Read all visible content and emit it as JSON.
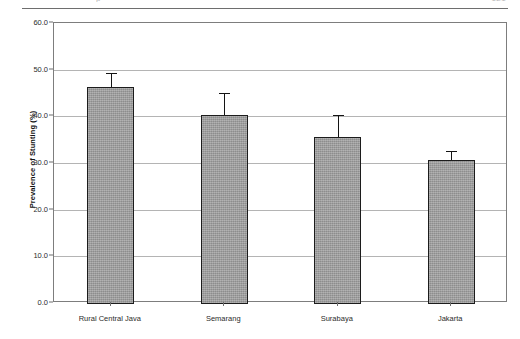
{
  "page_header": {
    "clipped_left_text": "p",
    "clipped_right_text": "121"
  },
  "figure": {
    "y_axis_title": "Prevalence of Stunting (%)"
  },
  "chart_data": {
    "type": "bar",
    "title": "",
    "xlabel": "",
    "ylabel": "Prevalence of Stunting (%)",
    "ylim": [
      0.0,
      60.0
    ],
    "ytick_step": 10.0,
    "ytick_labels": [
      "0.0",
      "10.0",
      "20.0",
      "30.0",
      "40.0",
      "50.0",
      "60.0"
    ],
    "ytick_values": [
      0.0,
      10.0,
      20.0,
      30.0,
      40.0,
      50.0,
      60.0
    ],
    "grid": "horizontal",
    "legend": "none",
    "bar_color": "#9b9b9b",
    "bar_edge_color": "#1c1c1c",
    "error_bar_color": "#141414",
    "categories": [
      "Rural Central Java",
      "Semarang",
      "Surabaya",
      "Jakarta"
    ],
    "values": [
      46.3,
      40.3,
      35.6,
      30.6
    ],
    "errors_upper": [
      3.0,
      4.7,
      4.7,
      2.0
    ],
    "errors_lower": [
      0.0,
      0.0,
      0.0,
      0.0
    ],
    "error_style": "upper-only-cap"
  }
}
